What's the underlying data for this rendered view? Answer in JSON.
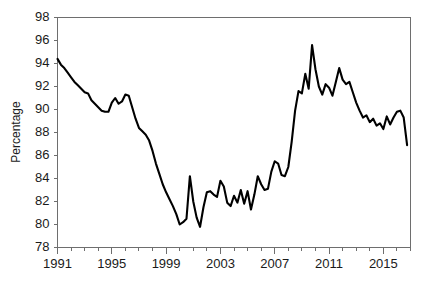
{
  "chart_data": {
    "type": "line",
    "title": "",
    "subtitle": "",
    "xlabel": "",
    "ylabel": "Percentage",
    "xlim": [
      1991.0,
      2017.0
    ],
    "ylim": [
      78,
      98
    ],
    "ytick_step": 2,
    "grid": false,
    "legend": null,
    "legend_position": "none",
    "yticks": [
      78,
      80,
      82,
      84,
      86,
      88,
      90,
      92,
      94,
      96,
      98
    ],
    "ytick_labels": [
      "78",
      "80",
      "82",
      "84",
      "86",
      "88",
      "90",
      "92",
      "94",
      "96",
      "98"
    ],
    "xticks": [
      1991,
      1992,
      1993,
      1994,
      1995,
      1996,
      1997,
      1998,
      1999,
      2000,
      2001,
      2002,
      2003,
      2004,
      2005,
      2006,
      2007,
      2008,
      2009,
      2010,
      2011,
      2012,
      2013,
      2014,
      2015,
      2016,
      2017
    ],
    "xtick_labels_shown": [
      "1991",
      "1995",
      "1999",
      "2003",
      "2007",
      "2011",
      "2015"
    ],
    "xtick_labels_shown_values": [
      1991,
      1995,
      1999,
      2003,
      2007,
      2011,
      2015
    ],
    "series": [
      {
        "name": "Percentage",
        "color": "#000000",
        "x": [
          1991.0,
          1991.25,
          1991.5,
          1991.75,
          1992.0,
          1992.25,
          1992.5,
          1992.75,
          1993.0,
          1993.25,
          1993.5,
          1993.75,
          1994.0,
          1994.25,
          1994.5,
          1994.75,
          1995.0,
          1995.25,
          1995.5,
          1995.75,
          1996.0,
          1996.25,
          1996.5,
          1996.75,
          1997.0,
          1997.25,
          1997.5,
          1997.75,
          1998.0,
          1998.25,
          1998.5,
          1998.75,
          1999.0,
          1999.25,
          1999.5,
          1999.75,
          2000.0,
          2000.25,
          2000.5,
          2000.75,
          2001.0,
          2001.25,
          2001.5,
          2001.75,
          2002.0,
          2002.25,
          2002.5,
          2002.75,
          2003.0,
          2003.25,
          2003.5,
          2003.75,
          2004.0,
          2004.25,
          2004.5,
          2004.75,
          2005.0,
          2005.25,
          2005.5,
          2005.75,
          2006.0,
          2006.25,
          2006.5,
          2006.75,
          2007.0,
          2007.25,
          2007.5,
          2007.75,
          2008.0,
          2008.25,
          2008.5,
          2008.75,
          2009.0,
          2009.25,
          2009.5,
          2009.75,
          2010.0,
          2010.25,
          2010.5,
          2010.75,
          2011.0,
          2011.25,
          2011.5,
          2011.75,
          2012.0,
          2012.25,
          2012.5,
          2012.75,
          2013.0,
          2013.25,
          2013.5,
          2013.75,
          2014.0,
          2014.25,
          2014.5,
          2014.75,
          2015.0,
          2015.25,
          2015.5,
          2015.75,
          2016.0,
          2016.25,
          2016.5,
          2016.75
        ],
        "values": [
          94.4,
          93.9,
          93.6,
          93.2,
          92.8,
          92.4,
          92.1,
          91.8,
          91.5,
          91.4,
          90.8,
          90.5,
          90.2,
          89.9,
          89.8,
          89.8,
          90.6,
          91.0,
          90.5,
          90.7,
          91.3,
          91.2,
          90.2,
          89.2,
          88.4,
          88.1,
          87.8,
          87.3,
          86.4,
          85.3,
          84.4,
          83.5,
          82.8,
          82.2,
          81.6,
          80.9,
          80.0,
          80.2,
          80.5,
          84.2,
          82.0,
          80.6,
          79.8,
          81.5,
          82.8,
          82.9,
          82.6,
          82.4,
          83.8,
          83.3,
          81.9,
          81.6,
          82.5,
          81.9,
          83.0,
          81.8,
          82.9,
          81.3,
          82.6,
          84.2,
          83.5,
          83.0,
          83.1,
          84.6,
          85.5,
          85.3,
          84.3,
          84.2,
          85.0,
          87.2,
          89.9,
          91.6,
          91.4,
          93.1,
          91.8,
          95.6,
          93.5,
          92.0,
          91.3,
          92.2,
          91.9,
          91.2,
          92.4,
          93.6,
          92.6,
          92.2,
          92.4,
          91.5,
          90.6,
          89.9,
          89.3,
          89.5,
          88.9,
          89.2,
          88.6,
          88.8,
          88.3,
          89.4,
          88.7,
          89.3,
          89.8,
          89.9,
          89.3,
          86.9
        ]
      }
    ],
    "annotations": []
  },
  "axes": {
    "y_axis_title": "Percentage"
  }
}
